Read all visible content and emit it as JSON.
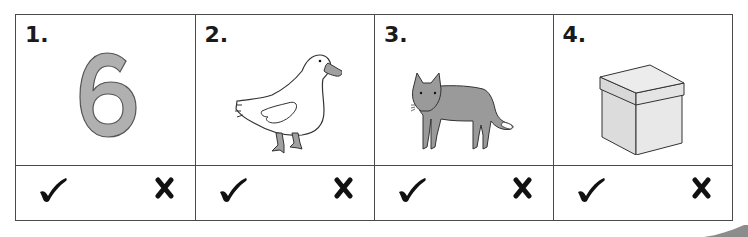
{
  "worksheet": {
    "items": [
      {
        "number": "1.",
        "picture": "digit-six",
        "picture_text": "6",
        "answer_options": {
          "correct": "✔",
          "incorrect": "✘"
        }
      },
      {
        "number": "2.",
        "picture": "duck",
        "answer_options": {
          "correct": "✔",
          "incorrect": "✘"
        }
      },
      {
        "number": "3.",
        "picture": "wolf",
        "answer_options": {
          "correct": "✔",
          "incorrect": "✘"
        }
      },
      {
        "number": "4.",
        "picture": "box",
        "answer_options": {
          "correct": "✔",
          "incorrect": "✘"
        }
      }
    ]
  },
  "colors": {
    "border": "#4a4a4a",
    "ink": "#1a1a1a",
    "fill_gray": "#a8a8a8",
    "fill_light": "#e6e6e6",
    "page_curl": "#8c8c8c"
  }
}
